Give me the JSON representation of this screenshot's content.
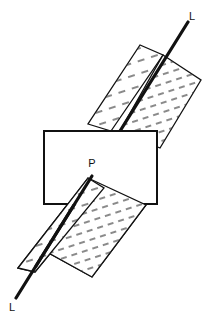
{
  "figure": {
    "background_color": "#ffffff",
    "line_color": "#111111",
    "hatch_color": "#3a3a3a",
    "fill_color": "#ffffff",
    "width": 208,
    "height": 324
  },
  "labels": {
    "line_top": "L",
    "line_bottom": "L",
    "plane": "P"
  },
  "elements": {
    "fold_line_name": "L",
    "plane_name": "P",
    "upper_fold": {
      "left_face": "upper-left-face",
      "right_face": "upper-right-face"
    },
    "lower_fold": {
      "left_face": "lower-left-face",
      "right_face": "lower-right-face"
    },
    "rectangle": "plane-p-rectangle"
  },
  "geometry": {
    "fold_line": {
      "x1": 16,
      "y1": 298,
      "x2": 188,
      "y2": 22
    },
    "rectangle": {
      "x": 44,
      "y": 131,
      "width": 113,
      "height": 73
    },
    "upper_left_face": "111,131 163,55 140,45 88,124",
    "upper_right_face": "163,55 201,80 160,148 120,131",
    "lower_left_face": "18,268 88,178 104,188 35,272",
    "lower_right_face": "88,178 146,205 92,277 36,246"
  },
  "label_positions": {
    "line_top": {
      "x": 192,
      "y": 20
    },
    "line_bottom": {
      "x": 12,
      "y": 311
    },
    "plane": {
      "x": 92,
      "y": 167
    }
  }
}
